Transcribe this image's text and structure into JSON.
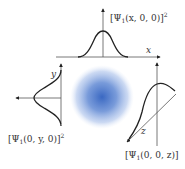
{
  "figure": {
    "colors": {
      "cloud_center": "#3a68c2",
      "cloud_edge": "#dfe8f8",
      "axis": "#555555",
      "curve": "#222222"
    },
    "top_plot": {
      "label_prefix": "[Ψ",
      "label_sub": "1",
      "label_args": "(x, 0, 0)]",
      "label_sup": "2",
      "axis_label": "x"
    },
    "left_plot": {
      "label_prefix": "[Ψ",
      "label_sub": "1",
      "label_args": "(0, y, 0)]",
      "label_sup": "2",
      "axis_label": "y"
    },
    "right_plot": {
      "label_prefix": "[Ψ",
      "label_sub": "1",
      "label_args": "(0, 0, z)]",
      "axis_label": "z"
    }
  }
}
